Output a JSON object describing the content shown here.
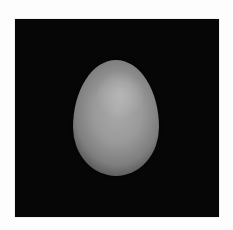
{
  "image": {
    "subject": "egg",
    "description": "A single gray-white egg on a black background, framed by a thin white border",
    "colors": {
      "border": "#fdfdfd",
      "background": "#060606",
      "egg_highlight": "#b4b4b4",
      "egg_mid": "#9a9a9a",
      "egg_shadow": "#4e4e4e"
    }
  }
}
